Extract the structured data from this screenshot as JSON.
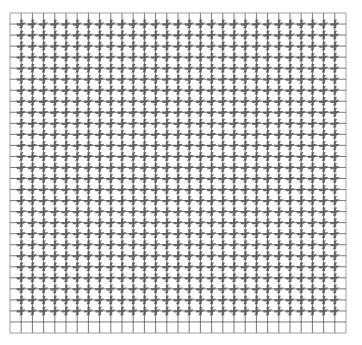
{
  "figure": {
    "title": "",
    "grid": {
      "left": 10,
      "top": 13,
      "right": 346,
      "bottom": 333,
      "columns": 30,
      "rows": 29,
      "line_color": "#555555",
      "border_color": "#888888"
    },
    "glyph": {
      "shape": "pinwheel",
      "color": "#5a5a5a",
      "placement": "interior-intersections"
    }
  }
}
